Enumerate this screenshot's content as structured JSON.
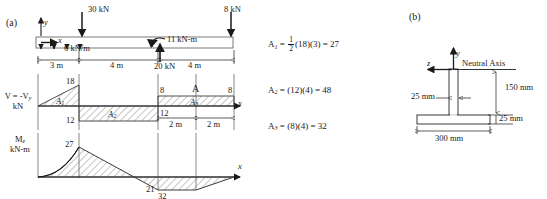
{
  "figure": {
    "panel_a_label": "(a)",
    "panel_b_label": "(b)"
  },
  "beam": {
    "axis_y": "y",
    "axis_x": "x",
    "point_load_1": "30 kN",
    "point_load_2": "8 kN",
    "distributed_load": "6 kN/m",
    "applied_moment": "11 kN-m",
    "reaction": "20 kN",
    "dim_1": "3 m",
    "dim_2": "4 m",
    "dim_3": "4 m"
  },
  "shear_diagram": {
    "label_line1": "V = -V",
    "label_sub": "y",
    "label_line2": "kN",
    "axis_x": "x",
    "value_peak_pos": "18",
    "value_neg": "12",
    "value_right_left": "8",
    "value_right_right": "8",
    "value_right_neg": "12",
    "area_1": "A",
    "area_1_sub": "1",
    "area_2": "A",
    "area_2_sub": "2",
    "area_3": "A",
    "area_3_sub": "3",
    "marker_A": "A",
    "dim_left": "2 m",
    "dim_right": "2 m"
  },
  "moment_diagram": {
    "label_line1": "M",
    "label_sub": "z",
    "label_line2": "kN-m",
    "axis_x": "x",
    "value_peak": "27",
    "value_min": "21",
    "value_min2": "32"
  },
  "area_equations": [
    {
      "lhs": "A",
      "lhs_sub": "1",
      "eq1": "=",
      "frac_num": "1",
      "frac_den": "2",
      "terms": "(18)(3)",
      "eq2": "=",
      "result": "27"
    },
    {
      "lhs": "A",
      "lhs_sub": "2",
      "eq1": "=",
      "terms": "(12)(4)",
      "eq2": "=",
      "result": "48"
    },
    {
      "lhs": "A",
      "lhs_sub": "3",
      "eq1": "=",
      "terms": "(8)(4)",
      "eq2": "=",
      "result": "32"
    }
  ],
  "cross_section": {
    "axis_y": "y",
    "axis_z": "z",
    "neutral_axis_label": "Neutral Axis",
    "web_thickness": "25 mm",
    "web_height": "150 mm",
    "flange_thickness": "25 mm",
    "flange_width": "300 mm"
  },
  "colors": {
    "ink": "#1a1a1a",
    "line": "#3a3a3a",
    "hatch": "#555555",
    "background": "#ffffff"
  }
}
